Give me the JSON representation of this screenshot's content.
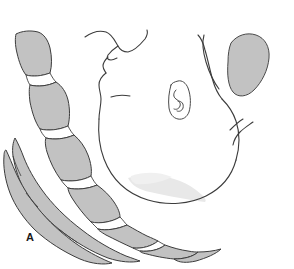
{
  "figure": {
    "panel_label": "A",
    "background_color": "#ffffff",
    "line_color": "#3c3c3c",
    "bone_fill_color": "#c2c2c2",
    "disc_fill_color": "#ffffff",
    "soft_shadow_color": "#e3e3e3",
    "mass_fill_color": "#c2c2c2",
    "width": 294,
    "height": 269
  },
  "structures": {
    "head_profile": {
      "name": "lateral head and face profile",
      "parts": [
        "forehead",
        "nose",
        "upper lip",
        "lower lip",
        "chin",
        "mandible",
        "occiput"
      ]
    },
    "ear": {
      "name": "auricle"
    },
    "shaded_mass": {
      "name": "shaded elongated oval mass"
    },
    "vertebral_bodies": {
      "name": "cervical vertebral bodies",
      "count": 7,
      "fill": "#c2c2c2"
    },
    "intervertebral_discs": {
      "name": "intervertebral disc spaces",
      "count": 6,
      "fill": "#ffffff"
    },
    "spinous_processes": {
      "name": "posterior spinous processes",
      "count": 2
    },
    "soft_tissue_shadow": {
      "name": "submandibular soft tissue shading"
    }
  }
}
